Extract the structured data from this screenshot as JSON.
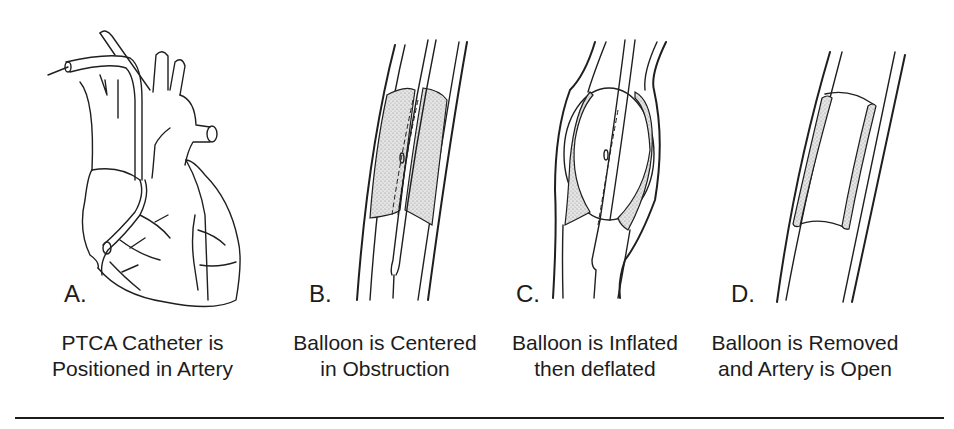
{
  "figure": {
    "panels": [
      {
        "letter": "A.",
        "caption_line1": "PTCA Catheter is",
        "caption_line2": "Positioned in Artery",
        "illustration": "heart-with-catheter"
      },
      {
        "letter": "B.",
        "caption_line1": "Balloon is Centered",
        "caption_line2": "in Obstruction",
        "illustration": "balloon-centered-in-artery"
      },
      {
        "letter": "C.",
        "caption_line1": "Balloon is Inflated",
        "caption_line2": "then deflated",
        "illustration": "balloon-inflated-in-artery"
      },
      {
        "letter": "D.",
        "caption_line1": "Balloon is Removed",
        "caption_line2": "and Artery is Open",
        "illustration": "open-artery"
      }
    ],
    "colors": {
      "ink": "#1c1c1c",
      "background": "#ffffff",
      "plaque": "#d9d9d9"
    }
  }
}
